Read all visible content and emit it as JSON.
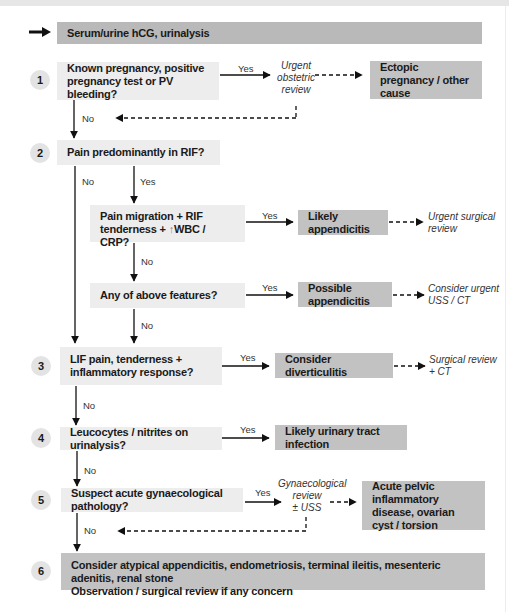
{
  "header": {
    "label": "Serum/urine hCG, urinalysis",
    "arrow_icon": "right-arrow-icon"
  },
  "steps": [
    {
      "number": "1",
      "question": "Known pregnancy, positive pregnancy test or PV bleeding?"
    },
    {
      "number": "2",
      "question": "Pain predominantly in RIF?"
    },
    {
      "number": "3",
      "question": "LIF pain, tenderness + inflammatory response?"
    },
    {
      "number": "4",
      "question": "Leucocytes / nitrites on urinalysis?"
    },
    {
      "number": "5",
      "question": "Suspect acute gynaecological pathology?"
    },
    {
      "number": "6",
      "line1": "Consider atypical appendicitis, endometriosis, terminal ileitis, mesenteric adenitis, renal stone",
      "line2": "Observation / surgical review if any concern"
    }
  ],
  "sub_questions": {
    "pain_migration": {
      "prefix": "Pain migration + RIF tenderness + ",
      "arrow": "↑",
      "suffix": "WBC / CRP?"
    },
    "any_features": "Any of above features?"
  },
  "results": {
    "ectopic": "Ectopic pregnancy / other cause",
    "likely_appendicitis": "Likely appendicitis",
    "possible_appendicitis": "Possible appendicitis",
    "diverticulitis": "Consider diverticulitis",
    "uti": "Likely urinary tract infection",
    "pelvic": "Acute pelvic inflammatory disease, ovarian cyst / torsion"
  },
  "actions": {
    "obstetric": [
      "Urgent",
      "obstetric",
      "review"
    ],
    "urgent_surgical": [
      "Urgent surgical",
      "review"
    ],
    "consider_uss": [
      "Consider urgent",
      "USS / CT"
    ],
    "surgical_ct": [
      "Surgical review",
      "+ CT"
    ],
    "gynae": [
      "Gynaecological",
      "review",
      "± USS"
    ]
  },
  "edge_labels": {
    "yes": "Yes",
    "no": "No"
  },
  "colors": {
    "question_fill": "#ededed",
    "result_fill": "#c2c2c2",
    "header_fill": "#b9b9b9",
    "circle_fill": "#e3e3e3"
  }
}
